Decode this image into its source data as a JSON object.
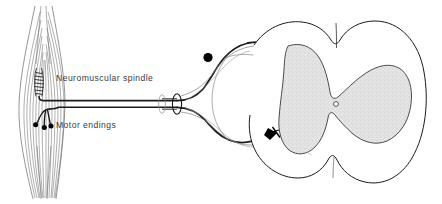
{
  "figure": {
    "background_color": "#ffffff",
    "line_color": "#1a1a1a",
    "fine_line_color": "#555555",
    "gray_matter_fill": "#e2e2e2",
    "gray_matter_stipple": "#b8b8b8",
    "label_color": "#3b3b3b"
  },
  "labels": {
    "spindle": "Neuromuscular spindle",
    "motor_endings": "Motor endings"
  },
  "structures": {
    "muscle": {
      "name": "skeletal-muscle",
      "fiber_count": 13,
      "fiber_color": "#6e6e6e"
    },
    "spindle_organ": {
      "name": "neuromuscular-spindle",
      "coil_turns": 7
    },
    "motor_end_plates": {
      "name": "motor-end-plates",
      "count": 3,
      "color": "#000000"
    },
    "nerve_trunk": {
      "name": "nerve-trunk",
      "cut_section": "ellipse"
    },
    "dorsal_root_ganglion": {
      "name": "dorsal-root-ganglion",
      "color": "#000000"
    },
    "anterior_horn_synapse": {
      "name": "anterior-horn-motor-neuron",
      "color": "#000000"
    },
    "central_canal": {
      "name": "central-canal",
      "color": "#ffffff"
    },
    "spinal_cord": {
      "name": "spinal-cord-cross-section"
    }
  }
}
